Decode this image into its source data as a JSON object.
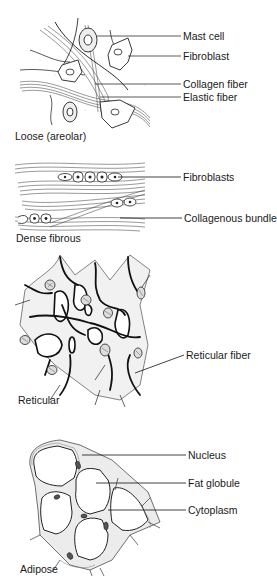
{
  "figure": {
    "clipped_header": "",
    "panels": [
      {
        "id": "loose",
        "caption": "Loose (areolar)",
        "labels": [
          "Mast cell",
          "Fibroblast",
          "Collagen fiber",
          "Elastic fiber"
        ]
      },
      {
        "id": "dense",
        "caption": "Dense fibrous",
        "labels": [
          "Fibroblasts",
          "Collagenous bundles"
        ]
      },
      {
        "id": "reticular",
        "caption": "Reticular",
        "labels": [
          "Reticular fiber"
        ]
      },
      {
        "id": "adipose",
        "caption": "Adipose",
        "labels": [
          "Nucleus",
          "Fat globule",
          "Cytoplasm"
        ]
      }
    ]
  }
}
